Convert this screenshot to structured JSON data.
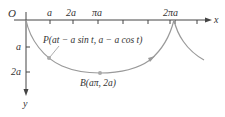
{
  "diagram": {
    "colors": {
      "axis": "#444444",
      "curve": "#9a9a9a",
      "point": "#aaaaaa",
      "text": "#333333"
    },
    "axes": {
      "origin_label": "O",
      "x_label": "x",
      "y_label": "y",
      "x_ticks": [
        "a",
        "2a",
        "πa",
        "2πa"
      ],
      "y_ticks": [
        "a",
        "2a"
      ]
    },
    "points": {
      "P": {
        "label": "P(at − a sin t, a − a cos t)"
      },
      "B": {
        "label": "B(aπ, 2a)"
      }
    }
  }
}
